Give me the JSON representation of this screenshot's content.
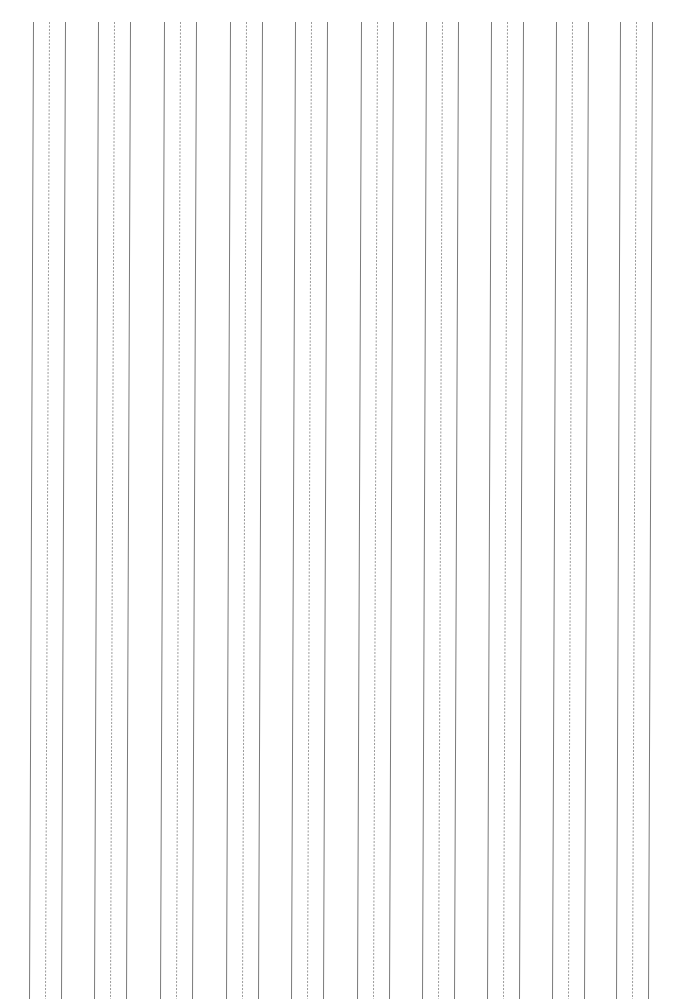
{
  "page": {
    "type": "handwriting practice paper (vertical guide lines)",
    "width": 679,
    "height": 999,
    "background": "#ffffff"
  },
  "guides": {
    "line_top_y": 22,
    "line_bottom_y": 999,
    "skew_px_over_height": -4,
    "solid_color": "#7a7a7a",
    "dashed_color": "#9a9a9a",
    "solid_width": 1,
    "dashed_width": 1,
    "dash_pattern": "2,1.5",
    "group_offsets": [
      0,
      16,
      32
    ],
    "group_styles": [
      "solid",
      "dashed",
      "solid"
    ],
    "groups_x": [
      33,
      98,
      164,
      230,
      295,
      361,
      426,
      491,
      556,
      620
    ]
  }
}
